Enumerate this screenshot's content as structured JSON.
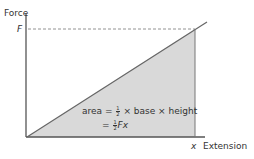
{
  "diagram": {
    "y_axis_label": "Force",
    "y_tick_label": "F",
    "x_axis_label": "Extension",
    "x_tick_label": "x",
    "area_line1": {
      "prefix": "area = ",
      "frac_num": "1",
      "frac_den": "2",
      "suffix": " × base × height"
    },
    "area_line2": {
      "prefix": "= ",
      "frac_num": "1",
      "frac_den": "2",
      "suffix": "Fx"
    },
    "colors": {
      "axis": "#555555",
      "line": "#666666",
      "fill": "#d9d9d9",
      "dashed": "#777777"
    }
  }
}
